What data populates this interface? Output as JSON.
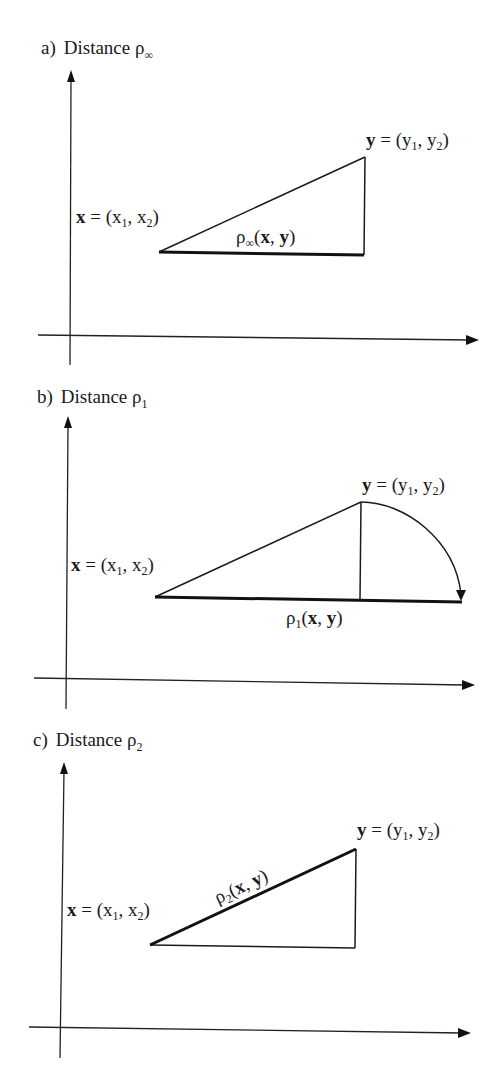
{
  "panels": [
    {
      "id": "a",
      "prefix": "a)",
      "title": "Distance ρ",
      "title_sub": "∞",
      "x_label": {
        "bold": "x",
        "eq": " = (x",
        "s1": "1",
        "mid": ", x",
        "s2": "2",
        "end": ")"
      },
      "y_label": {
        "bold": "y",
        "eq": " = (y",
        "s1": "1",
        "mid": ", y",
        "s2": "2",
        "end": ")"
      },
      "distance_label": {
        "rho": "ρ",
        "sub": "∞",
        "open": "(",
        "x": "x",
        "comma": ", ",
        "y": "y",
        "close": ")"
      },
      "highlighted_segment": "horizontal leg"
    },
    {
      "id": "b",
      "prefix": "b)",
      "title": "Distance ρ",
      "title_sub": "1",
      "x_label": {
        "bold": "x",
        "eq": " = (x",
        "s1": "1",
        "mid": ", x",
        "s2": "2",
        "end": ")"
      },
      "y_label": {
        "bold": "y",
        "eq": " = (y",
        "s1": "1",
        "mid": ", y",
        "s2": "2",
        "end": ")"
      },
      "distance_label": {
        "rho": "ρ",
        "sub": "1",
        "open": "(",
        "x": "x",
        "comma": ", ",
        "y": "y",
        "close": ")"
      },
      "highlighted_segment": "horizontal leg extended by rotated vertical leg"
    },
    {
      "id": "c",
      "prefix": "c)",
      "title": "Distance ρ",
      "title_sub": "2",
      "x_label": {
        "bold": "x",
        "eq": " = (x",
        "s1": "1",
        "mid": ", x",
        "s2": "2",
        "end": ")"
      },
      "y_label": {
        "bold": "y",
        "eq": " = (y",
        "s1": "1",
        "mid": ", y",
        "s2": "2",
        "end": ")"
      },
      "distance_label": {
        "rho": "ρ",
        "sub": "2",
        "open": "(",
        "x": "x",
        "comma": ", ",
        "y": "y",
        "close": ")"
      },
      "highlighted_segment": "hypotenuse"
    }
  ]
}
